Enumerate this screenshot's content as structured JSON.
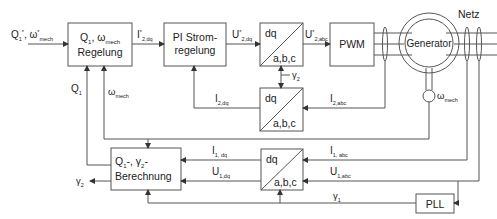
{
  "diagram": {
    "title": "",
    "blocks": {
      "regelung": {
        "line1": "Q",
        "line1_sub": "1",
        "line1_mid": ", ω",
        "line1_sub2": "mech",
        "line2": "Regelung"
      },
      "pi": {
        "line1": "PI Strom-",
        "line2": "regelung"
      },
      "dq_abc_top": {
        "top": "dq",
        "bottom": "a,b,c"
      },
      "pwm": {
        "label": "PWM"
      },
      "generator": {
        "label": "Generator"
      },
      "dq_abc_mid": {
        "top": "dq",
        "bottom": "a,b,c"
      },
      "berechnung": {
        "line1": "Q",
        "line1_sub": "1",
        "line1_mid": "-, γ",
        "line1_sub2": "2",
        "line1_end": "-",
        "line2": "Berechnung"
      },
      "dq_abc_bot": {
        "top": "dq",
        "bottom": "a,b,c"
      },
      "pll": {
        "label": "PLL"
      }
    },
    "signals": {
      "input_ref": {
        "a": "Q",
        "a_sub": "1",
        "a_sup": "*",
        "b": ", ω",
        "b_sup": "*",
        "b_sub": "mech"
      },
      "i2dq_ref": {
        "main": "I",
        "sup": "*",
        "sub": "2,dq"
      },
      "u2dq_ref": {
        "main": "U",
        "sup": "*",
        "sub": "2,dq"
      },
      "u2abc_ref": {
        "main": "U",
        "sup": "*",
        "sub": "2,abc"
      },
      "gamma2_top": {
        "main": "γ",
        "sub": "2"
      },
      "i2dq": {
        "main": "I",
        "sub": "2,dq"
      },
      "i2abc": {
        "main": "I",
        "sub": "2,abc"
      },
      "q1": {
        "main": "Q",
        "sub": "1"
      },
      "omega_mech_left": {
        "main": "ω",
        "sub": "mech"
      },
      "omega_mech_gen": {
        "main": "ω",
        "sub": "mech"
      },
      "i1dq": {
        "main": "I",
        "sub": "1, dq"
      },
      "u1dq": {
        "main": "U",
        "sub": "1,dq"
      },
      "i1abc": {
        "main": "I",
        "sub": "1, abc"
      },
      "u1abc": {
        "main": "U",
        "sub": "1,abc"
      },
      "gamma1": {
        "main": "γ",
        "sub": "1"
      },
      "gamma2_out": {
        "main": "γ",
        "sub": "2"
      },
      "netz": {
        "main": "Netz"
      }
    },
    "colors": {
      "line": "#555555",
      "text": "#222222",
      "background": "#ffffff"
    }
  }
}
